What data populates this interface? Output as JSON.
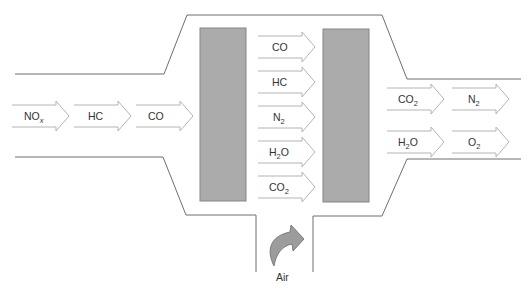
{
  "diagram": {
    "colors": {
      "outline": "#6e6e6e",
      "arrow_stroke": "#b4b4b4",
      "block_fill": "#ababab",
      "block_stroke": "#858585",
      "air_arrow_fill": "#9c9c9c",
      "text": "#333333"
    },
    "inlet_arrows": [
      {
        "base": "NO",
        "sub": "x",
        "sub_italic": true
      },
      {
        "base": "HC",
        "sub": ""
      },
      {
        "base": "CO",
        "sub": ""
      }
    ],
    "middle_arrows": [
      {
        "base": "CO",
        "sub": ""
      },
      {
        "base": "HC",
        "sub": ""
      },
      {
        "base": "N",
        "sub": "2"
      },
      {
        "base": "H",
        "sub": "2",
        "tail": "O"
      },
      {
        "base": "CO",
        "sub": "2"
      }
    ],
    "outlet_arrows": [
      {
        "base": "CO",
        "sub": "2"
      },
      {
        "base": "N",
        "sub": "2"
      },
      {
        "base": "H",
        "sub": "2",
        "tail": "O"
      },
      {
        "base": "O",
        "sub": "2"
      }
    ],
    "air_label": "Air",
    "catalyst_blocks": [
      "catalyst-bed-1",
      "catalyst-bed-2"
    ]
  }
}
